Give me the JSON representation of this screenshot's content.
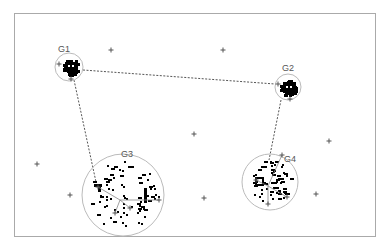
{
  "diagram": {
    "frame": {
      "x": 14,
      "y": 13,
      "width": 361,
      "height": 223,
      "stroke": "#aaaaaa"
    },
    "colors": {
      "circle": "#bbbbbb",
      "dashed": "#555555",
      "point": "#000000",
      "plus": "#555555",
      "spoke": "#888888"
    },
    "groups": [
      {
        "id": "G1",
        "label": "G1",
        "cx": 69,
        "cy": 67,
        "r": 14,
        "label_x": 58,
        "label_y": 52,
        "blob": "dense",
        "bx": 71,
        "by": 67
      },
      {
        "id": "G2",
        "label": "G2",
        "cx": 288,
        "cy": 87,
        "r": 13,
        "label_x": 282,
        "label_y": 71,
        "blob": "dense",
        "bx": 289,
        "by": 88
      },
      {
        "id": "G3",
        "label": "G3",
        "cx": 123,
        "cy": 195,
        "r": 41,
        "label_x": 121,
        "label_y": 157,
        "blob": "sparse",
        "bx": 120,
        "by": 200
      },
      {
        "id": "G4",
        "label": "G4",
        "cx": 270,
        "cy": 182,
        "r": 28,
        "label_x": 284,
        "label_y": 162,
        "blob": "sparse",
        "bx": 268,
        "by": 186
      }
    ],
    "connections": [
      {
        "from": "G1",
        "to": "G2",
        "x1": 83,
        "y1": 70,
        "x2": 275,
        "y2": 84
      },
      {
        "from": "G1",
        "to": "G3",
        "x1": 74,
        "y1": 80,
        "x2": 96,
        "y2": 182
      },
      {
        "from": "G2",
        "to": "G4",
        "x1": 281,
        "y1": 100,
        "x2": 269,
        "y2": 160
      }
    ],
    "outliers": [
      [
        111,
        50
      ],
      [
        223,
        50
      ],
      [
        194,
        134
      ],
      [
        37,
        164
      ],
      [
        70,
        195
      ],
      [
        204,
        198
      ],
      [
        329,
        141
      ],
      [
        316,
        194
      ]
    ]
  }
}
